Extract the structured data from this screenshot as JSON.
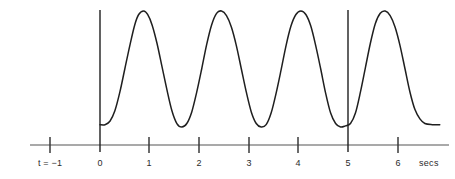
{
  "figure": {
    "background_color": "#ffffff",
    "curve_color": "#1f1f1f",
    "axis_color": "#8c8c8c",
    "tick_color": "#333333",
    "marker_line_color": "#1f1f1f",
    "text_color": "#2b2b2b"
  },
  "axis": {
    "unit_label": "secs",
    "start_label": "t = −1",
    "tick_labels": [
      "t = −1",
      "0",
      "1",
      "2",
      "3",
      "4",
      "5",
      "6"
    ],
    "tick_values": [
      -1,
      0,
      1,
      2,
      3,
      4,
      5,
      6
    ],
    "baseline_y": 145,
    "x_start_px": 30,
    "x_end_px": 449
  },
  "markers": {
    "vertical_lines": [
      {
        "label": "0",
        "t": 0
      },
      {
        "label": "5",
        "t": 5
      }
    ]
  },
  "chart_data": {
    "type": "line",
    "title": "",
    "xlabel": "secs",
    "ylabel": "",
    "xlim": [
      -1.4,
      7.0
    ],
    "ylim": [
      0,
      1.1
    ],
    "grid": false,
    "legend": null,
    "period_secs": 1.55,
    "series": [
      {
        "name": "signal",
        "x": [
          0.0,
          0.1,
          0.2,
          0.3,
          0.4,
          0.5,
          0.6,
          0.7,
          0.78,
          0.88,
          0.96,
          1.05,
          1.15,
          1.25,
          1.35,
          1.45,
          1.55,
          1.65,
          1.75,
          1.85,
          1.95,
          2.05,
          2.15,
          2.25,
          2.35,
          2.45,
          2.55,
          2.65,
          2.75,
          2.85,
          2.95,
          3.05,
          3.15,
          3.25,
          3.35,
          3.45,
          3.55,
          3.65,
          3.75,
          3.85,
          3.95,
          4.05,
          4.15,
          4.25,
          4.35,
          4.45,
          4.55,
          4.65,
          4.75,
          4.85,
          4.95,
          5.05,
          5.15,
          5.25,
          5.35,
          5.45,
          5.55,
          5.65,
          5.75,
          5.85,
          5.95,
          6.05,
          6.15,
          6.25,
          6.35,
          6.45,
          6.55,
          6.7,
          6.85
        ],
        "y": [
          0.02,
          0.02,
          0.05,
          0.14,
          0.3,
          0.5,
          0.7,
          0.88,
          0.97,
          1.0,
          0.97,
          0.88,
          0.72,
          0.52,
          0.32,
          0.14,
          0.03,
          0.0,
          0.03,
          0.13,
          0.3,
          0.5,
          0.71,
          0.88,
          0.98,
          1.0,
          0.96,
          0.86,
          0.7,
          0.5,
          0.3,
          0.13,
          0.03,
          0.0,
          0.02,
          0.12,
          0.29,
          0.49,
          0.7,
          0.87,
          0.97,
          1.0,
          0.97,
          0.87,
          0.7,
          0.5,
          0.29,
          0.12,
          0.03,
          0.0,
          0.01,
          0.03,
          0.12,
          0.3,
          0.51,
          0.72,
          0.89,
          0.98,
          1.0,
          0.96,
          0.86,
          0.7,
          0.5,
          0.3,
          0.15,
          0.07,
          0.03,
          0.02,
          0.02
        ]
      }
    ]
  }
}
